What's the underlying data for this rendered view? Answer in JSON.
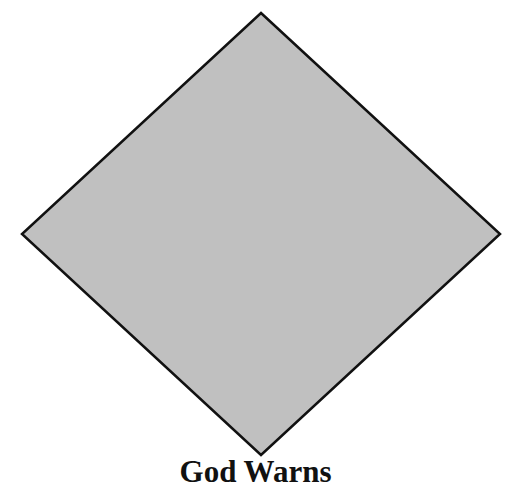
{
  "diagram": {
    "shape": "diamond",
    "fill_color": "#c0c0c0",
    "stroke_color": "#111111",
    "caption": "God Warns"
  }
}
